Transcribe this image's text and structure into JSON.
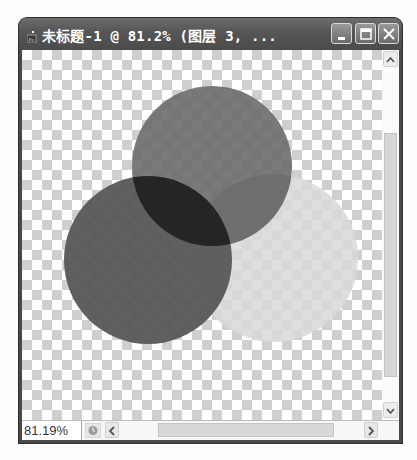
{
  "window": {
    "title": "未标题-1 @ 81.2% (图层 3, ...",
    "icon": "photoshop-document-icon",
    "buttons": {
      "minimize": "minimize",
      "maximize": "maximize",
      "close": "close"
    }
  },
  "canvas": {
    "background": "transparency-checkerboard",
    "checker_colors": [
      "#ffffff",
      "#cfcfcf"
    ],
    "shapes": [
      {
        "name": "top-circle",
        "cx": 190,
        "cy": 116,
        "r": 80,
        "color": "#6e6e6e",
        "opacity": 0.85
      },
      {
        "name": "right-circle",
        "cx": 252,
        "cy": 208,
        "r": 84,
        "color": "#d8d8d8",
        "opacity": 0.85
      },
      {
        "name": "left-circle",
        "cx": 126,
        "cy": 210,
        "r": 84,
        "color": "#5c5c5c",
        "opacity": 0.9
      }
    ],
    "overlap_color": "#262626"
  },
  "status": {
    "zoom": "81.19%",
    "icon": "status-info-icon"
  },
  "scrollbars": {
    "vertical": {
      "up": "scroll-up",
      "down": "scroll-down"
    },
    "horizontal": {
      "left": "scroll-left",
      "right": "scroll-right"
    }
  }
}
